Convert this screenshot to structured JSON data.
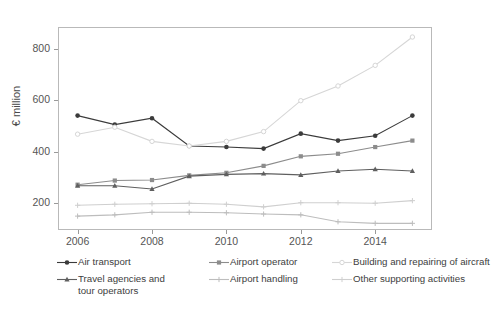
{
  "chart_data": {
    "type": "line",
    "title": "",
    "xlabel": "",
    "ylabel": "€ million",
    "x": [
      2006,
      2007,
      2008,
      2009,
      2010,
      2011,
      2012,
      2013,
      2014,
      2015
    ],
    "xtick_labels": [
      "2006",
      "2008",
      "2010",
      "2012",
      "2014"
    ],
    "xtick_values": [
      2006,
      2008,
      2010,
      2012,
      2014
    ],
    "ytick_labels": [
      "200",
      "400",
      "600",
      "800"
    ],
    "ytick_values": [
      200,
      400,
      600,
      800
    ],
    "xlim": [
      2005.5,
      2015.5
    ],
    "ylim": [
      100,
      880
    ],
    "grid": false,
    "legend_position": "bottom",
    "series": [
      {
        "name": "Air transport",
        "color": "#3b3b3b",
        "marker": "circle",
        "values": [
          540,
          505,
          530,
          422,
          418,
          412,
          470,
          443,
          462,
          540
        ]
      },
      {
        "name": "Airport operator",
        "color": "#8c8c8c",
        "marker": "square",
        "values": [
          272,
          288,
          290,
          308,
          318,
          345,
          382,
          392,
          418,
          443
        ]
      },
      {
        "name": "Building and repairing of aircraft",
        "color": "#d6d6d6",
        "marker": "circle-open",
        "values": [
          468,
          495,
          440,
          422,
          440,
          478,
          598,
          655,
          735,
          845
        ]
      },
      {
        "name": "Travel agencies and tour operators",
        "color": "#5f5f5f",
        "marker": "triangle",
        "values": [
          268,
          268,
          255,
          305,
          312,
          315,
          310,
          325,
          332,
          325
        ]
      },
      {
        "name": "Airport handling",
        "color": "#bdbdbd",
        "marker": "plus",
        "values": [
          150,
          155,
          165,
          165,
          163,
          158,
          155,
          128,
          122,
          122
        ]
      },
      {
        "name": "Other supporting activities",
        "color": "#cfcfcf",
        "marker": "plus",
        "values": [
          192,
          196,
          198,
          200,
          196,
          186,
          202,
          202,
          200,
          210
        ]
      }
    ],
    "legend_entries": [
      {
        "label": "Air transport",
        "color": "#3b3b3b",
        "marker": "circle"
      },
      {
        "label": "Airport operator",
        "color": "#8c8c8c",
        "marker": "square"
      },
      {
        "label": "Building and repairing of aircraft",
        "color": "#d6d6d6",
        "marker": "circle-open"
      },
      {
        "label": "Travel agencies and tour operators",
        "color": "#5f5f5f",
        "marker": "triangle"
      },
      {
        "label": "Airport handling",
        "color": "#bdbdbd",
        "marker": "plus"
      },
      {
        "label": "Other supporting activities",
        "color": "#cfcfcf",
        "marker": "plus"
      }
    ]
  }
}
